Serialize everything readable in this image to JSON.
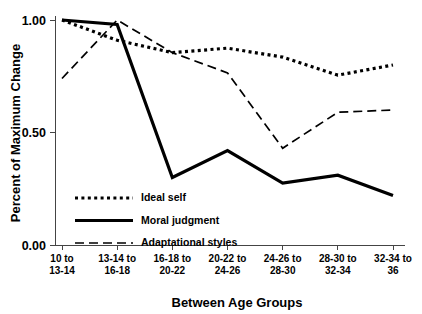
{
  "chart_data": {
    "type": "line",
    "title": "",
    "xlabel": "Between Age Groups",
    "ylabel": "Percent of Maximum Change",
    "categories": [
      "10 to\n13-14",
      "13-14 to\n16-18",
      "16-18 to\n20-22",
      "20-22 to\n24-26",
      "24-26 to\n28-30",
      "28-30 to\n32-34",
      "32-34 to\n36"
    ],
    "category_lines": [
      [
        "10 to",
        "13-14"
      ],
      [
        "13-14 to",
        "16-18"
      ],
      [
        "16-18 to",
        "20-22"
      ],
      [
        "20-22 to",
        "24-26"
      ],
      [
        "24-26 to",
        "28-30"
      ],
      [
        "28-30 to",
        "32-34"
      ],
      [
        "32-34 to",
        "36"
      ]
    ],
    "ylim": [
      0.0,
      1.0
    ],
    "yticks": [
      0.0,
      0.5,
      1.0
    ],
    "ytick_labels": [
      "0.00",
      "0.50",
      "1.00"
    ],
    "grid": false,
    "legend_position": "lower-left-inside",
    "series": [
      {
        "name": "Ideal self",
        "style": "dotted",
        "color": "#000000",
        "values": [
          1.0,
          0.91,
          0.855,
          0.875,
          0.835,
          0.755,
          0.8
        ]
      },
      {
        "name": "Moral judgment",
        "style": "solid",
        "color": "#000000",
        "values": [
          1.0,
          0.98,
          0.3,
          0.42,
          0.275,
          0.31,
          0.22
        ]
      },
      {
        "name": "Adaptational styles",
        "style": "dashed",
        "color": "#000000",
        "values": [
          0.74,
          1.0,
          0.855,
          0.765,
          0.43,
          0.59,
          0.6
        ]
      }
    ]
  },
  "legend": {
    "items": [
      {
        "label": "Ideal self"
      },
      {
        "label": "Moral judgment"
      },
      {
        "label": "Adaptational styles"
      }
    ]
  }
}
